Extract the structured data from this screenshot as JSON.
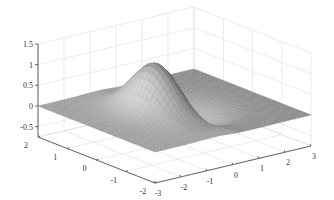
{
  "chart_data": {
    "type": "surface3d",
    "title": "",
    "xlabel": "",
    "ylabel": "",
    "zlabel": "",
    "function": "z = 2*x*exp(-x^2 - y^2) style saddle bump (peak ~1.2, trough ~-0.55)",
    "x_range": [
      -3,
      3
    ],
    "y_range": [
      -2,
      2
    ],
    "zlim": [
      -0.75,
      1.5
    ],
    "x_ticks": [
      -3,
      -2,
      -1,
      0,
      1,
      2,
      3
    ],
    "y_ticks": [
      -2,
      -1,
      0,
      1,
      2
    ],
    "z_ticks": [
      -0.5,
      0,
      0.5,
      1,
      1.5
    ],
    "x_tick_labels": [
      "-3",
      "-2",
      "-1",
      "0",
      "1",
      "2",
      "3"
    ],
    "y_tick_labels": [
      "-2",
      "-1",
      "0",
      "1",
      "2"
    ],
    "z_tick_labels": [
      "-0.5",
      "0",
      "0.5",
      "1",
      "1.5"
    ],
    "peak": {
      "x": -0.7,
      "y": 0,
      "z": 1.25
    },
    "trough": {
      "x": 0.7,
      "y": 0,
      "z": -0.55
    },
    "grid": true,
    "colormap": "gray",
    "legend": null
  }
}
